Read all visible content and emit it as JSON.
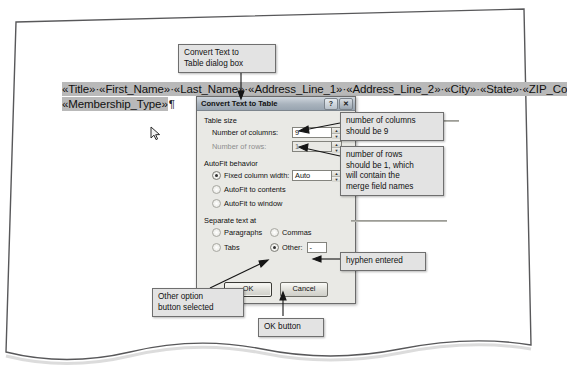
{
  "document": {
    "lines": [
      "«Title»·«First_Name»·«Last_Name»·«Address_Line_1»·«Address_Line_2»·«City»·«State»·«ZIP_Co",
      "«Membership_Type»"
    ],
    "paragraph_mark": "¶",
    "cursor_icon": "mouse-pointer-icon"
  },
  "dialog": {
    "title": "Convert Text to Table",
    "help_button": "?",
    "close_button": "✕",
    "groups": {
      "table_size": {
        "legend": "Table size",
        "columns_label": "Number of columns:",
        "columns_value": "9",
        "rows_label": "Number of rows:",
        "rows_value": "1",
        "rows_disabled": true
      },
      "autofit": {
        "legend": "AutoFit behavior",
        "options": [
          {
            "label": "Fixed column width:",
            "selected": true,
            "accel": "w"
          },
          {
            "label": "AutoFit to contents",
            "selected": false,
            "accel": "F"
          },
          {
            "label": "AutoFit to window",
            "selected": false,
            "accel": "w"
          }
        ],
        "fixed_width_value": "Auto"
      },
      "separate": {
        "legend": "Separate text at",
        "options": [
          {
            "label": "Paragraphs",
            "selected": false
          },
          {
            "label": "Commas",
            "selected": false
          },
          {
            "label": "Tabs",
            "selected": false
          },
          {
            "label": "Other:",
            "selected": true
          }
        ],
        "other_value": "-"
      }
    },
    "buttons": {
      "ok": "OK",
      "cancel": "Cancel"
    }
  },
  "callouts": {
    "dialog_name": "Convert Text to\nTable dialog box",
    "columns": "number of columns\nshould be 9",
    "rows": "number of rows\nshould be 1, which\nwill contain the\nmerge field names",
    "hyphen": "hyphen entered",
    "other_option": "Other option\nbutton selected",
    "ok_button": "OK button"
  },
  "colors": {
    "selection_highlight": "#b9b9b9",
    "callout_fill": "#e3e3e3",
    "dialog_face": "#e9e9e5",
    "titlebar": "#a9b3bd",
    "leader_line": "#151515"
  }
}
